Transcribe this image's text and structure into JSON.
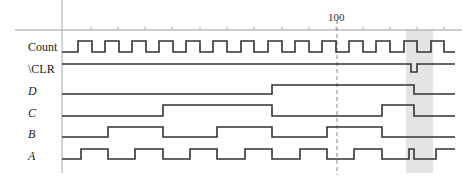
{
  "diagram": {
    "type": "timing-diagram",
    "time_marker": {
      "label": "100",
      "x": 337
    },
    "highlight_band": {
      "x_start": 406,
      "x_end": 433,
      "color": "#e4e4e4"
    },
    "axis": {
      "x_origin": 62,
      "x_end": 462,
      "y": 30,
      "ticks": [
        91,
        118,
        145,
        172,
        200,
        227,
        254,
        282,
        309,
        336,
        363,
        390,
        417,
        444
      ]
    },
    "signals": [
      {
        "name": "Count",
        "italic": false,
        "y_low": 52,
        "y_high": 41,
        "label_y": 40,
        "initial": 0,
        "transitions": [
          78,
          92,
          105,
          119,
          132,
          146,
          159,
          173,
          186,
          200,
          213,
          227,
          241,
          254,
          268,
          282,
          295,
          309,
          322,
          336,
          349,
          363,
          376,
          390,
          404,
          417,
          431,
          444
        ]
      },
      {
        "name": "\\CLR",
        "italic": false,
        "y_low": 72,
        "y_high": 64,
        "label_y": 62,
        "initial": 1,
        "transitions": [
          411,
          417
        ]
      },
      {
        "name": "D",
        "italic": true,
        "y_low": 94,
        "y_high": 85,
        "label_y": 84,
        "initial": 0,
        "transitions": [
          272,
          414
        ]
      },
      {
        "name": "C",
        "italic": true,
        "y_low": 116,
        "y_high": 105,
        "label_y": 106,
        "initial": 0,
        "transitions": [
          163,
          272,
          382,
          414
        ]
      },
      {
        "name": "B",
        "italic": true,
        "y_low": 137,
        "y_high": 127,
        "label_y": 127,
        "initial": 0,
        "transitions": [
          108,
          163,
          217,
          272,
          327,
          382
        ]
      },
      {
        "name": "A",
        "italic": true,
        "y_low": 159,
        "y_high": 149,
        "label_y": 149,
        "initial": 0,
        "transitions": [
          81,
          108,
          135,
          163,
          190,
          217,
          245,
          272,
          300,
          327,
          354,
          382,
          409,
          414,
          436
        ]
      }
    ],
    "signal_x_start": 62,
    "signal_x_end": 455
  }
}
